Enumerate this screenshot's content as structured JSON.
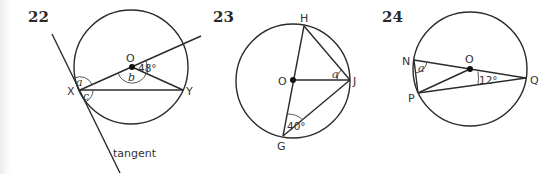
{
  "diagrams": [
    {
      "number": "22",
      "points": {
        "O": "O",
        "X": "X",
        "Y": "Y"
      },
      "angles": {
        "given": "48°",
        "a": "a",
        "b": "b",
        "c": "c"
      },
      "annotation": "tangent"
    },
    {
      "number": "23",
      "points": {
        "H": "H",
        "O": "O",
        "J": "J",
        "G": "G"
      },
      "angles": {
        "given": "40°",
        "a": "a"
      }
    },
    {
      "number": "24",
      "points": {
        "N": "N",
        "O": "O",
        "P": "P",
        "Q": "Q"
      },
      "angles": {
        "given": "12°",
        "a": "a"
      }
    }
  ]
}
